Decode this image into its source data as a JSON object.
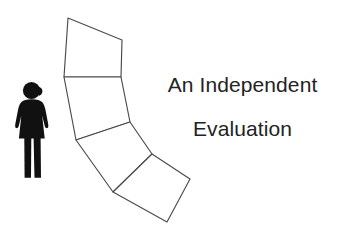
{
  "canvas": {
    "width": 354,
    "height": 238,
    "background_color": "#ffffff"
  },
  "heading": {
    "full_text": "An Independent Evaluation",
    "line1": "An Independent",
    "line2": "Evaluation",
    "color": "#232323",
    "align": "center"
  },
  "figure": {
    "name": "female-pictogram",
    "color": "#111111"
  },
  "path_chain": {
    "name": "curved-quadrilateral-chain",
    "description": "A chain of four hand-drawn quadrilaterals forming a curving ribbon or road receding to the lower right",
    "stroke_color": "#4a4a4a",
    "fill_color": "#ffffff",
    "segment_count": 4,
    "segments": [
      {
        "id": "segment-1",
        "points": "68,18 122,40 121,77 64,77"
      },
      {
        "id": "segment-2",
        "points": "64,77 121,77 130,122 76,140"
      },
      {
        "id": "segment-3",
        "points": "76,140 130,122 152,154 113,192"
      },
      {
        "id": "segment-4",
        "points": "113,192 152,154 190,179 167,222"
      }
    ]
  }
}
